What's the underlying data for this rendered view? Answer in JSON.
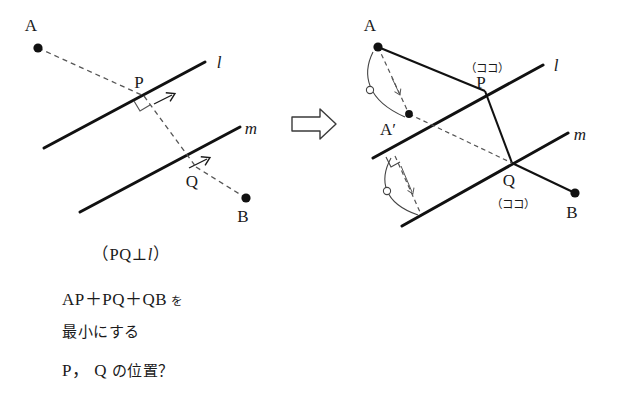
{
  "figure": {
    "title_text": null,
    "left_diagram": {
      "name": "initial-configuration",
      "points": [
        {
          "id": "A",
          "label": "A",
          "x": 38,
          "y": 48,
          "label_dx": -10,
          "label_dy": -12
        },
        {
          "id": "P",
          "label": "P",
          "x": 144,
          "y": 96,
          "label_dx": -6,
          "label_dy": -10
        },
        {
          "id": "Q",
          "label": "Q",
          "x": 196,
          "y": 167,
          "label_dx": -5,
          "label_dy": 19
        },
        {
          "id": "B",
          "label": "B",
          "x": 246,
          "y": 198,
          "label_dx": -5,
          "label_dy": 22
        }
      ],
      "lines": [
        {
          "id": "l",
          "label": "l",
          "x1": 44,
          "y1": 148,
          "x2": 205,
          "y2": 62,
          "label_x": 219,
          "label_y": 62,
          "arrow_at": 0.72
        },
        {
          "id": "m",
          "label": "m",
          "x1": 80,
          "y1": 212,
          "x2": 240,
          "y2": 127,
          "label_x": 250,
          "label_y": 128,
          "arrow_at": 0.72
        }
      ],
      "dashed_paths": [
        {
          "id": "A-to-P",
          "from": "A",
          "to": "P"
        },
        {
          "id": "P-to-Q",
          "from": "P",
          "to": "Q"
        },
        {
          "id": "Q-to-B",
          "from": "Q",
          "to": "B"
        }
      ],
      "right_angle_marks": [
        {
          "id": "right-angle-at-P",
          "x": 144,
          "y": 96
        }
      ]
    },
    "transform_arrow": {
      "name": "implies-arrow",
      "glyph": "block-arrow-right",
      "x": 292,
      "y": 110,
      "width": 44,
      "height": 28
    },
    "right_diagram": {
      "name": "construction-solution",
      "points": [
        {
          "id": "A",
          "label": "A",
          "x": 378,
          "y": 47,
          "label_dx": -11,
          "label_dy": -12
        },
        {
          "id": "Aprime",
          "label": "A′",
          "x": 409,
          "y": 114,
          "label_dx": -30,
          "label_dy": 17
        },
        {
          "id": "P",
          "label": "P",
          "x": 485,
          "y": 91,
          "label_dx": -6,
          "label_dy": -4
        },
        {
          "id": "Q",
          "label": "Q",
          "x": 512,
          "y": 163,
          "label_dx": -5,
          "label_dy": 20
        },
        {
          "id": "B",
          "label": "B",
          "x": 575,
          "y": 193,
          "label_dx": -5,
          "label_dy": 23
        }
      ],
      "lines": [
        {
          "id": "l",
          "label": "l",
          "x1": 373,
          "y1": 158,
          "x2": 543,
          "y2": 65,
          "label_x": 556,
          "label_y": 65
        },
        {
          "id": "m",
          "label": "m",
          "x1": 402,
          "y1": 226,
          "x2": 568,
          "y2": 133,
          "label_x": 579,
          "label_y": 134
        }
      ],
      "solid_paths": [
        {
          "id": "A-to-P",
          "from": "A",
          "to": "P"
        },
        {
          "id": "P-to-Q",
          "from": "P",
          "to": "Q"
        },
        {
          "id": "Q-to-B",
          "from": "Q",
          "to": "B"
        }
      ],
      "dashed_paths": [
        {
          "id": "A-to-Aprime",
          "from": "A",
          "to": "Aprime"
        },
        {
          "id": "Aprime-to-Q",
          "from": "Aprime",
          "to": "Q"
        }
      ],
      "arcs": [
        {
          "id": "arc-A-to-Aprime",
          "tick": "circle",
          "cx": 382,
          "cy": 85
        },
        {
          "id": "arc-reflection-lower",
          "tick": "circle",
          "cx": 399,
          "cy": 190
        }
      ],
      "right_angle_marks": [
        {
          "id": "right-angle-lower-reflection",
          "x": 393,
          "y": 160
        }
      ],
      "annotations": [
        {
          "id": "here-at-P",
          "text": "（ココ）",
          "x": 464,
          "y": 71
        },
        {
          "id": "here-at-Q",
          "text": "（ココ）",
          "x": 490,
          "y": 208
        }
      ]
    }
  },
  "caption": {
    "condition": {
      "prefix": "（PQ",
      "perp_symbol": "⊥",
      "line_name": "l",
      "suffix": "）"
    },
    "question": {
      "line1_math": "AP＋PQ＋QB",
      "line1_particle": "を",
      "line2": "最小にする",
      "line3_points": "P， Q",
      "line3_rest": "の位置？"
    }
  },
  "colors": {
    "ink": "#1a1a1a",
    "line_solid": "#111111",
    "line_dashed": "#555555",
    "arc": "#444444",
    "background": "#ffffff"
  }
}
